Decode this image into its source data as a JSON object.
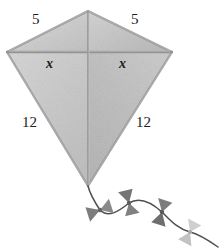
{
  "figure": {
    "background_color": "#ffffff",
    "ink_color": "#1c1c1c",
    "kite": {
      "fill_upper_left": "#cbcbcb",
      "fill_upper_right": "#c2c2c2",
      "fill_lower_left": "#c9c9c9",
      "fill_lower_right": "#bdbdbd",
      "edge_color": "#8c8c8c",
      "spar_color": "#9a9a9a",
      "vertices": {
        "top": [
          88,
          11
        ],
        "left": [
          7,
          52
        ],
        "right": [
          172,
          52
        ],
        "bottom": [
          88,
          186
        ]
      }
    },
    "labels": [
      {
        "id": "top-left",
        "text": "5",
        "style": "number"
      },
      {
        "id": "top-right",
        "text": "5",
        "style": "number"
      },
      {
        "id": "x-left",
        "text": "x",
        "style": "variable"
      },
      {
        "id": "x-right",
        "text": "x",
        "style": "variable"
      },
      {
        "id": "side-left",
        "text": "12",
        "style": "number"
      },
      {
        "id": "side-right",
        "text": "12",
        "style": "number"
      }
    ],
    "tail": {
      "string_color": "#4f4f4f",
      "bows": [
        {
          "index": 1,
          "color": "#7d7d7d",
          "x": 100,
          "y": 210
        },
        {
          "index": 2,
          "color": "#707070",
          "x": 129,
          "y": 203
        },
        {
          "index": 3,
          "color": "#6e6e6e",
          "x": 162,
          "y": 212
        },
        {
          "index": 4,
          "color": "#c0c0c0",
          "x": 190,
          "y": 232
        }
      ]
    }
  }
}
